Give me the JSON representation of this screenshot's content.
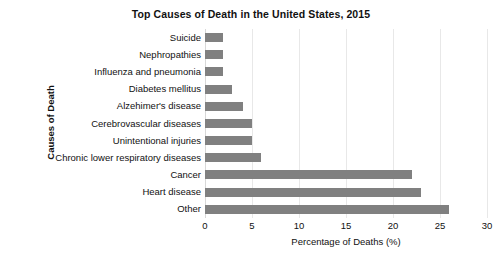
{
  "chart_data": {
    "type": "bar",
    "orientation": "horizontal",
    "title": "Top Causes of Death in the United States, 2015",
    "xlabel": "Percentage of Deaths (%)",
    "ylabel": "Causes of Death",
    "categories": [
      "Suicide",
      "Nephropathies",
      "Influenza and pneumonia",
      "Diabetes mellitus",
      "Alzehimer's disease",
      "Cerebrovascular diseases",
      "Unintentional injuries",
      "Chronic lower respiratory diseases",
      "Cancer",
      "Heart disease",
      "Other"
    ],
    "values": [
      1.9,
      1.9,
      1.9,
      2.9,
      4.0,
      5.0,
      5.0,
      6.0,
      22.0,
      23.0,
      26.0
    ],
    "xlim": [
      0,
      30
    ],
    "xticks": [
      0,
      5,
      10,
      15,
      20,
      25,
      30
    ],
    "xtick_labels": [
      "0",
      "5",
      "10",
      "15",
      "20",
      "25",
      "30"
    ],
    "grid": true,
    "grid_axis": "x",
    "legend": false,
    "bar_color": "#808080",
    "grid_color": "#e8e8e8",
    "background_color": "#ffffff",
    "text_color": "#111111"
  }
}
